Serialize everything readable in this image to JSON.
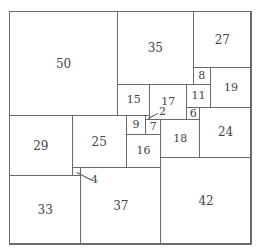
{
  "diagram": {
    "title": "",
    "total_size": 112,
    "squares": [
      {
        "size": 50,
        "x": 0,
        "y": 0
      },
      {
        "size": 35,
        "x": 50,
        "y": 0
      },
      {
        "size": 27,
        "x": 85,
        "y": 0
      },
      {
        "size": 8,
        "x": 85,
        "y": 27
      },
      {
        "size": 19,
        "x": 93,
        "y": 27
      },
      {
        "size": 15,
        "x": 50,
        "y": 35
      },
      {
        "size": 17,
        "x": 65,
        "y": 35
      },
      {
        "size": 11,
        "x": 82,
        "y": 35
      },
      {
        "size": 6,
        "x": 82,
        "y": 46
      },
      {
        "size": 24,
        "x": 88,
        "y": 46
      },
      {
        "size": 29,
        "x": 0,
        "y": 50
      },
      {
        "size": 25,
        "x": 29,
        "y": 50
      },
      {
        "size": 9,
        "x": 54,
        "y": 50
      },
      {
        "size": 2,
        "x": 63,
        "y": 50,
        "external_label": true
      },
      {
        "size": 7,
        "x": 63,
        "y": 52
      },
      {
        "size": 18,
        "x": 70,
        "y": 52
      },
      {
        "size": 16,
        "x": 54,
        "y": 59
      },
      {
        "size": 42,
        "x": 70,
        "y": 70
      },
      {
        "size": 4,
        "x": 29,
        "y": 75,
        "external_label": true
      },
      {
        "size": 37,
        "x": 33,
        "y": 75
      },
      {
        "size": 33,
        "x": 0,
        "y": 79
      }
    ],
    "labels": {
      "s2": "2",
      "s4": "4"
    },
    "colors": {
      "line": "#6a6a6a",
      "text": "#444444",
      "background": "#ffffff"
    }
  }
}
